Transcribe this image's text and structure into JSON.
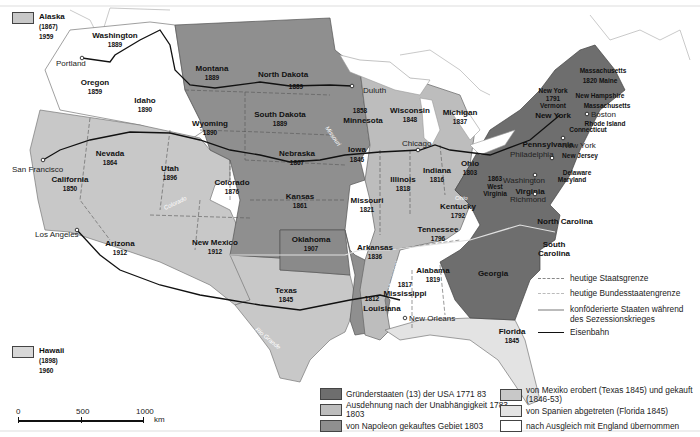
{
  "colors": {
    "founding": "#6e6e6e",
    "expansion_1783": "#bdbdbd",
    "louisiana_purchase": "#8f8f8f",
    "mexico": "#c8c8c8",
    "spain": "#e0e0e0",
    "england": "#ffffff",
    "border": "#555555",
    "railroad": "#111111"
  },
  "insets": {
    "alaska": {
      "name": "Alaska",
      "acquired": "(1867)",
      "statehood": "1959"
    },
    "hawaii": {
      "name": "Hawaii",
      "acquired": "(1898)",
      "statehood": "1960"
    }
  },
  "states": [
    {
      "name": "Washington",
      "year": "1889"
    },
    {
      "name": "Oregon",
      "year": "1859"
    },
    {
      "name": "Idaho",
      "year": "1890"
    },
    {
      "name": "Montana",
      "year": "1889"
    },
    {
      "name": "North Dakota",
      "year": "1889"
    },
    {
      "name": "South Dakota",
      "year": "1889"
    },
    {
      "name": "Wyoming",
      "year": "1890"
    },
    {
      "name": "Minnesota",
      "year": "1858"
    },
    {
      "name": "Wisconsin",
      "year": "1848"
    },
    {
      "name": "Michigan",
      "year": "1837"
    },
    {
      "name": "Nevada",
      "year": "1864"
    },
    {
      "name": "California",
      "year": "1850"
    },
    {
      "name": "Utah",
      "year": "1896"
    },
    {
      "name": "Colorado",
      "year": "1876"
    },
    {
      "name": "Nebraska",
      "year": "1867"
    },
    {
      "name": "Iowa",
      "year": "1846"
    },
    {
      "name": "Illinois",
      "year": "1818"
    },
    {
      "name": "Indiana",
      "year": "1816"
    },
    {
      "name": "Ohio",
      "year": "1803"
    },
    {
      "name": "Kansas",
      "year": "1861"
    },
    {
      "name": "Missouri",
      "year": "1821"
    },
    {
      "name": "Kentucky",
      "year": "1792"
    },
    {
      "name": "West Virginia",
      "year": "1863"
    },
    {
      "name": "Virginia",
      "year": ""
    },
    {
      "name": "Arizona",
      "year": "1912"
    },
    {
      "name": "New Mexico",
      "year": "1912"
    },
    {
      "name": "Oklahoma",
      "year": "1907"
    },
    {
      "name": "Arkansas",
      "year": "1836"
    },
    {
      "name": "Tennessee",
      "year": "1796"
    },
    {
      "name": "North Carolina",
      "year": ""
    },
    {
      "name": "South Carolina",
      "year": ""
    },
    {
      "name": "Georgia",
      "year": ""
    },
    {
      "name": "Alabama",
      "year": "1819"
    },
    {
      "name": "Mississippi",
      "year": "1817"
    },
    {
      "name": "Louisiana",
      "year": "1812"
    },
    {
      "name": "Texas",
      "year": "1845"
    },
    {
      "name": "Florida",
      "year": "1845"
    },
    {
      "name": "Pennsylvania",
      "year": ""
    },
    {
      "name": "New York",
      "year": ""
    },
    {
      "name": "Vermont",
      "year": "1791"
    },
    {
      "name": "New Hampshire",
      "year": ""
    },
    {
      "name": "Massachusetts",
      "year": ""
    },
    {
      "name": "Maine",
      "year": "1820"
    },
    {
      "name": "Rhode Island",
      "year": ""
    },
    {
      "name": "Connecticut",
      "year": ""
    },
    {
      "name": "New Jersey",
      "year": ""
    },
    {
      "name": "Delaware",
      "year": ""
    },
    {
      "name": "Maryland",
      "year": ""
    }
  ],
  "labels": {
    "ny_state_vermont": "New York",
    "vermont_year": "1791",
    "vermont": "Vermont",
    "ma_maine": "Massachusetts",
    "maine_line": "1820 Maine",
    "wv_year": "1863",
    "wv_1": "West",
    "wv_2": "Virginia"
  },
  "cities": [
    "Portland",
    "Duluth",
    "Chicago",
    "Boston",
    "New York",
    "Philadelphia",
    "Washington",
    "Richmond",
    "San Francisco",
    "Los Angeles",
    "New Orleans"
  ],
  "rivers": [
    "Colorado",
    "Missouri",
    "Ohio",
    "Mississippi",
    "Rio Grande"
  ],
  "line_legend": [
    {
      "label": "heutige Staatsgrenze"
    },
    {
      "label": "heutige Bundesstaatengrenze"
    },
    {
      "label": "konföderierte Staaten während des Sezessionskrieges"
    },
    {
      "label": "Eisenbahn"
    }
  ],
  "area_legend": [
    {
      "label": "Gründerstaaten (13) der USA 1771  83"
    },
    {
      "label": "Ausdehnung nach der Unabhängigkeit 1783-1803"
    },
    {
      "label": "von Napoleon gekauftes Gebiet 1803"
    },
    {
      "label": "von Mexiko erobert (Texas 1845) und gekauft (1846-53)"
    },
    {
      "label": "von Spanien abgetreten (Florida 1845)"
    },
    {
      "label": "nach Ausgleich mit  England übernommen"
    }
  ],
  "scale": {
    "ticks": [
      "0",
      "500",
      "1000"
    ],
    "unit": "km"
  }
}
